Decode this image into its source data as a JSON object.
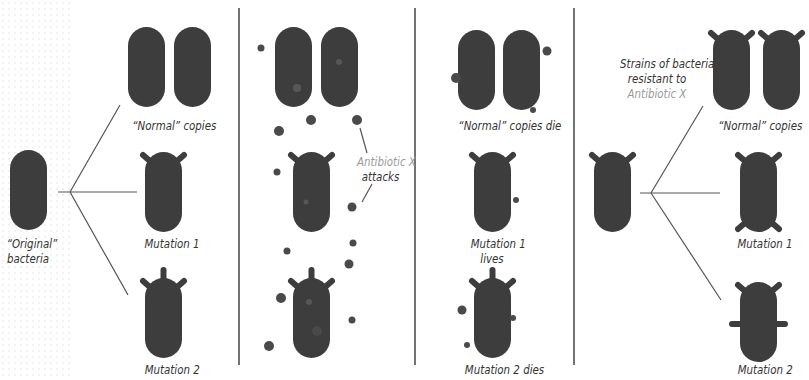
{
  "colors": {
    "bacteria": "#3d3d3d",
    "line": "#555555",
    "divider": "#444444",
    "antibiotic_dot": "#4a4a4a",
    "highlight_text": "#9a9a9a",
    "text": "#333333"
  },
  "panels": [
    {
      "id": "reproduction",
      "labels": {
        "original": [
          "“Original”",
          "bacteria"
        ],
        "normal": "“Normal” copies",
        "mutation1": "Mutation 1",
        "mutation2": "Mutation 2"
      }
    },
    {
      "id": "antibiotic-attack",
      "labels": {
        "antibiotic": "Antibiotic X",
        "attacks": "attacks"
      }
    },
    {
      "id": "selection",
      "labels": {
        "normal": "“Normal” copies die",
        "mutation1": [
          "Mutation 1",
          "lives"
        ],
        "mutation2": "Mutation 2 dies"
      }
    },
    {
      "id": "resistant-strains",
      "labels": {
        "strains": [
          "Strains of bacteria",
          "resistant to"
        ],
        "antibiotic": "Antibiotic X",
        "normal": "“Normal” copies",
        "mutation1": "Mutation 1",
        "mutation2": "Mutation 2"
      }
    }
  ]
}
